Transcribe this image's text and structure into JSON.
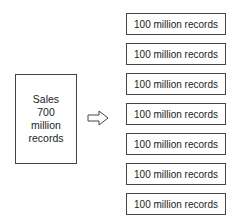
{
  "source": {
    "lines": [
      "Sales",
      "700",
      "million",
      "records"
    ]
  },
  "arrow": {
    "icon": "hollow-right-arrow-icon"
  },
  "partitions": [
    {
      "label": "100 million records"
    },
    {
      "label": "100 million records"
    },
    {
      "label": "100 million records"
    },
    {
      "label": "100 million records"
    },
    {
      "label": "100 million records"
    },
    {
      "label": "100 million records"
    },
    {
      "label": "100 million records"
    }
  ],
  "colors": {
    "border": "#444444",
    "text": "#222222",
    "background": "#ffffff"
  }
}
